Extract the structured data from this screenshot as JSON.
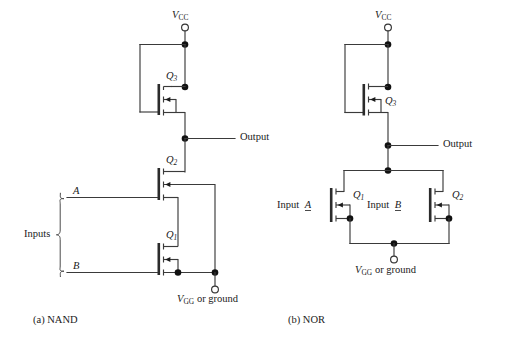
{
  "figure": {
    "kind": "schematic-diagram",
    "background_color": "#ffffff",
    "wire_color": "#3a3a3a",
    "node_color": "#111111"
  },
  "panels": [
    {
      "id": "nand",
      "caption": "(a) NAND",
      "supply_label": {
        "symbol": "V",
        "subscript": "CC"
      },
      "output_label": "Output",
      "inputs_label": "Inputs",
      "input_names": [
        "A",
        "B"
      ],
      "ground_label": {
        "symbol": "V",
        "subscript": "GG",
        "suffix": " or ground"
      },
      "transistors": [
        {
          "name": "Q",
          "index": "3",
          "role": "load"
        },
        {
          "name": "Q",
          "index": "2",
          "role": "driver-a"
        },
        {
          "name": "Q",
          "index": "1",
          "role": "driver-b"
        }
      ]
    },
    {
      "id": "nor",
      "caption": "(b) NOR",
      "supply_label": {
        "symbol": "V",
        "subscript": "CC"
      },
      "output_label": "Output",
      "input_a_label": "Input",
      "input_a_name": "A",
      "input_b_label": "Input",
      "input_b_name": "B",
      "ground_label": {
        "symbol": "V",
        "subscript": "GG",
        "suffix": " or ground"
      },
      "transistors": [
        {
          "name": "Q",
          "index": "3",
          "role": "load"
        },
        {
          "name": "Q",
          "index": "1",
          "role": "driver-a"
        },
        {
          "name": "Q",
          "index": "2",
          "role": "driver-b"
        }
      ]
    }
  ],
  "labels": {
    "vcc_a": "V",
    "vcc_a_sub": "CC",
    "vcc_b": "V",
    "vcc_b_sub": "CC",
    "vgg_a": "V",
    "vgg_a_sub": "GG",
    "vgg_a_suffix": " or ground",
    "vgg_b": "V",
    "vgg_b_sub": "GG",
    "vgg_b_suffix": " or ground",
    "output_a": "Output",
    "output_b": "Output",
    "inputs_a": "Inputs",
    "input_a_name": "A",
    "input_b_name": "B",
    "q3_a": "Q",
    "q3_a_sub": "3",
    "q2_a": "Q",
    "q2_a_sub": "2",
    "q1_a": "Q",
    "q1_a_sub": "1",
    "q3_b": "Q",
    "q3_b_sub": "3",
    "q1_b": "Q",
    "q1_b_sub": "1",
    "q2_b": "Q",
    "q2_b_sub": "2",
    "input_label_a_b": "Input",
    "input_name_a_b": "A",
    "input_label_b_b": "Input",
    "input_name_b_b": "B",
    "caption_a": "(a) NAND",
    "caption_b": "(b) NOR"
  }
}
